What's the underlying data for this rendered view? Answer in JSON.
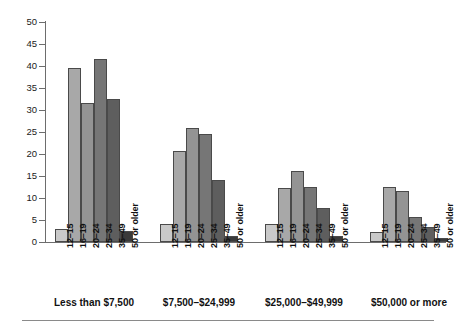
{
  "chart_data": {
    "type": "bar",
    "title": "",
    "subtitle": "",
    "xlabel": "",
    "ylabel": "",
    "ylim": [
      0,
      50
    ],
    "ytick_step": 5,
    "grid": false,
    "legend_position": "none",
    "categories": [
      "Less than $7,500",
      "$7,500–$24,999",
      "$25,000–$49,999",
      "$50,000 or more"
    ],
    "subcategories": [
      "12–15",
      "16–19",
      "20–24",
      "25–34",
      "35–49",
      "50 or older"
    ],
    "ytick_labels": [
      "0",
      "5",
      "10",
      "15",
      "20",
      "25",
      "30",
      "35",
      "40",
      "45",
      "50"
    ],
    "ytick_values": [
      0,
      5,
      10,
      15,
      20,
      25,
      30,
      35,
      40,
      45,
      50
    ],
    "series": [
      {
        "name": "12–15",
        "values": [
          3.0,
          4.2,
          4.2,
          2.2
        ],
        "color": "#c9c9c9"
      },
      {
        "name": "16–19",
        "values": [
          39.5,
          20.6,
          12.2,
          12.5
        ],
        "color": "#a8a8a8"
      },
      {
        "name": "20–24",
        "values": [
          31.5,
          26.0,
          16.2,
          11.6
        ],
        "color": "#949494"
      },
      {
        "name": "25–34",
        "values": [
          41.5,
          24.5,
          12.6,
          5.6
        ],
        "color": "#767676"
      },
      {
        "name": "35–49",
        "values": [
          32.5,
          14.2,
          7.7,
          3.3
        ],
        "color": "#5e5e5e"
      },
      {
        "name": "50 or older",
        "values": [
          2.6,
          1.4,
          1.4,
          1.0
        ],
        "color": "#3a3a3a"
      }
    ]
  },
  "axis": {
    "line_color": "#6d6d6d",
    "tick_color": "#6d6d6d"
  },
  "colors": {
    "background": "#ffffff",
    "text": "#111111",
    "rule": "#8a8a8a"
  }
}
